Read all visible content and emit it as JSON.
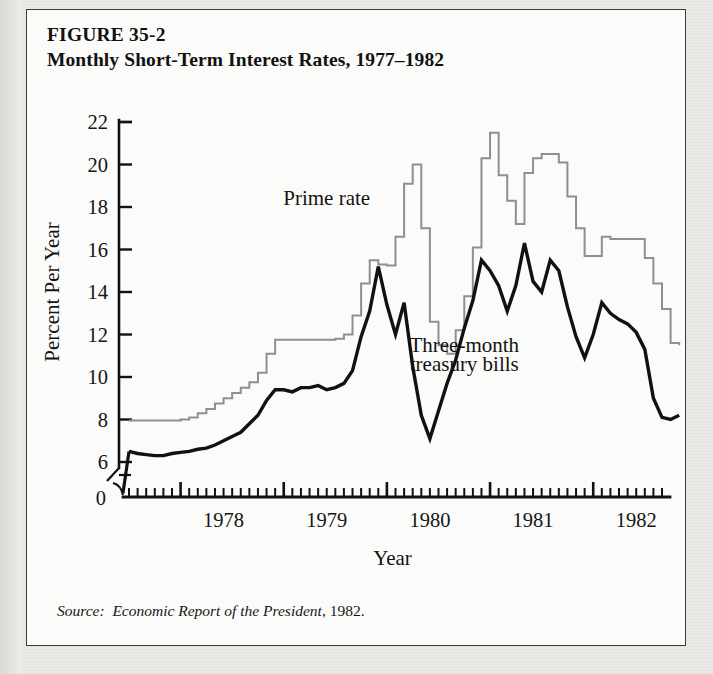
{
  "figure": {
    "number_line": "FIGURE 35-2",
    "title_line": "Monthly Short-Term Interest Rates, 1977–1982",
    "source_prefix": "Source:",
    "source_italic": "Economic Report of the President",
    "source_suffix": ", 1982."
  },
  "colors": {
    "prime": "#8f8f8f",
    "tbill": "#111111",
    "axis": "#111111",
    "page": "#fbfbf9",
    "frame": "#3a3a38"
  },
  "chart_data": {
    "type": "line",
    "title": "Monthly Short-Term Interest Rates, 1977–1982",
    "xlabel": "Year",
    "ylabel": "Percent Per Year",
    "ylim": [
      6,
      22
    ],
    "y_axis_break_below": 6,
    "y_zero_label": "0",
    "yticks": [
      6,
      8,
      10,
      12,
      14,
      16,
      18,
      20,
      22
    ],
    "ytick_labels": [
      "6",
      "8",
      "10",
      "12",
      "14",
      "16",
      "18",
      "20",
      "22"
    ],
    "xlim": [
      "1977-07",
      "1982-09"
    ],
    "xticks_major": [
      "1978",
      "1979",
      "1980",
      "1981",
      "1982"
    ],
    "xtick_labels": [
      "1978",
      "1979",
      "1980",
      "1981",
      "1982"
    ],
    "x_minor_tick_interval": "month",
    "grid": false,
    "legend_position": "inline-annotations",
    "annotations": [
      {
        "text": "Prime rate",
        "x_month": "1979-06",
        "y": 18.1
      },
      {
        "text": "Three-month",
        "x_month": "1980-10",
        "y": 11.2
      },
      {
        "text": "treasury bills",
        "x_month": "1980-10",
        "y": 10.3
      }
    ],
    "x_months": [
      "1977-07",
      "1977-08",
      "1977-09",
      "1977-10",
      "1977-11",
      "1977-12",
      "1978-01",
      "1978-02",
      "1978-03",
      "1978-04",
      "1978-05",
      "1978-06",
      "1978-07",
      "1978-08",
      "1978-09",
      "1978-10",
      "1978-11",
      "1978-12",
      "1979-01",
      "1979-02",
      "1979-03",
      "1979-04",
      "1979-05",
      "1979-06",
      "1979-07",
      "1979-08",
      "1979-09",
      "1979-10",
      "1979-11",
      "1979-12",
      "1980-01",
      "1980-02",
      "1980-03",
      "1980-04",
      "1980-05",
      "1980-06",
      "1980-07",
      "1980-08",
      "1980-09",
      "1980-10",
      "1980-11",
      "1980-12",
      "1981-01",
      "1981-02",
      "1981-03",
      "1981-04",
      "1981-05",
      "1981-06",
      "1981-07",
      "1981-08",
      "1981-09",
      "1981-10",
      "1981-11",
      "1981-12",
      "1982-01",
      "1982-02",
      "1982-03",
      "1982-04",
      "1982-05",
      "1982-06",
      "1982-07",
      "1982-08",
      "1982-09"
    ],
    "series": [
      {
        "name": "Prime rate",
        "color": "#8f8f8f",
        "style": "step",
        "values": [
          7.95,
          7.95,
          7.95,
          7.95,
          7.95,
          7.95,
          8.0,
          8.1,
          8.3,
          8.5,
          8.75,
          9.0,
          9.25,
          9.5,
          9.75,
          10.2,
          11.1,
          11.75,
          11.75,
          11.75,
          11.75,
          11.75,
          11.75,
          11.75,
          11.8,
          12.0,
          12.9,
          14.4,
          15.5,
          15.3,
          15.25,
          16.6,
          19.1,
          20.0,
          17.0,
          12.6,
          11.5,
          11.1,
          12.2,
          13.8,
          16.1,
          20.3,
          21.5,
          19.5,
          18.3,
          17.2,
          19.6,
          20.3,
          20.5,
          20.5,
          20.1,
          18.5,
          17.0,
          15.7,
          15.7,
          16.6,
          16.5,
          16.5,
          16.5,
          16.5,
          15.6,
          14.4,
          13.2,
          11.6,
          11.5
        ]
      },
      {
        "name": "Three-month treasury bills",
        "color": "#111111",
        "style": "line",
        "values": [
          6.5,
          6.4,
          6.35,
          6.3,
          6.3,
          6.4,
          6.45,
          6.5,
          6.6,
          6.65,
          6.8,
          7.0,
          7.2,
          7.4,
          7.8,
          8.2,
          8.9,
          9.4,
          9.4,
          9.3,
          9.5,
          9.5,
          9.6,
          9.4,
          9.5,
          9.7,
          10.3,
          11.9,
          13.1,
          15.2,
          13.4,
          12.0,
          13.5,
          10.5,
          8.2,
          7.1,
          8.4,
          9.7,
          10.8,
          12.3,
          13.6,
          15.5,
          15.0,
          14.3,
          13.1,
          14.3,
          16.3,
          14.5,
          14.0,
          15.5,
          15.0,
          13.3,
          11.9,
          10.9,
          12.0,
          13.5,
          13.0,
          12.7,
          12.5,
          12.1,
          11.3,
          9.0,
          8.1,
          8.0,
          8.2
        ]
      }
    ]
  }
}
